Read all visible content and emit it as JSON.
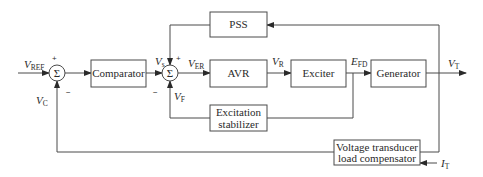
{
  "diagram": {
    "type": "block-diagram",
    "blocks": {
      "comparator": "Comparator",
      "pss": "PSS",
      "avr": "AVR",
      "exciter": "Exciter",
      "generator": "Generator",
      "stabilizer_line1": "Excitation",
      "stabilizer_line2": "stabilizer",
      "transducer_line1": "Voltage transducer",
      "transducer_line2": "load compensator"
    },
    "summers": {
      "symbol": "Σ"
    },
    "signals": {
      "vref": {
        "main": "V",
        "sub": "REF"
      },
      "vc": {
        "main": "V",
        "sub": "C"
      },
      "vs": {
        "main": "V",
        "sub": "s"
      },
      "ver": {
        "main": "V",
        "sub": "ER"
      },
      "vf": {
        "main": "V",
        "sub": "F"
      },
      "vr": {
        "main": "V",
        "sub": "R"
      },
      "efd": {
        "main": "E",
        "sub": "FD"
      },
      "vt": {
        "main": "V",
        "sub": "T"
      },
      "it": {
        "main": "I",
        "sub": "T"
      }
    },
    "signs": {
      "s1_plus": "+",
      "s1_minus": "−",
      "s2_plus": "+",
      "s2_minus": "−"
    }
  }
}
